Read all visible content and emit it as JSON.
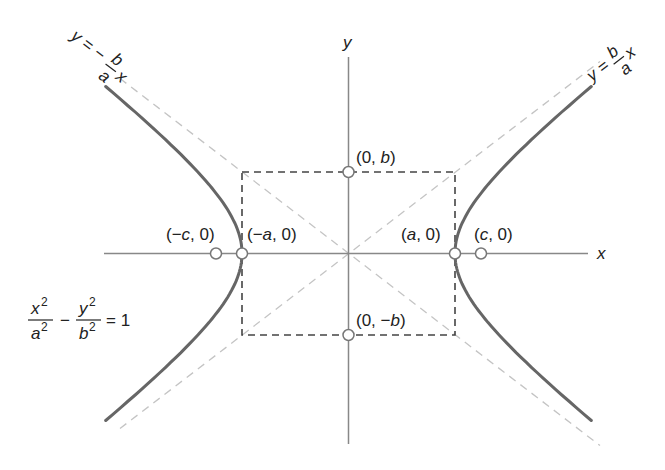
{
  "diagram": {
    "colors": {
      "curve": "#666666",
      "axis": "#888888",
      "asymptote": "#c4c4c4",
      "rectangle": "#444444",
      "text": "#222222",
      "point_fill": "#ffffff"
    },
    "axes": {
      "x_label": "x",
      "y_label": "y"
    },
    "asymptotes": {
      "positive": {
        "lhs": "y =",
        "num": "b",
        "den": "a",
        "var": "x"
      },
      "negative": {
        "lhs": "y = −",
        "num": "b",
        "den": "a",
        "var": "x"
      }
    },
    "points": [
      {
        "id": "vertex-left",
        "label_open": "(−",
        "label_var": "a",
        "label_close": ", 0)"
      },
      {
        "id": "vertex-right",
        "label_open": "(",
        "label_var": "a",
        "label_close": ", 0)"
      },
      {
        "id": "focus-left",
        "label_open": "(−",
        "label_var": "c",
        "label_close": ", 0)"
      },
      {
        "id": "focus-right",
        "label_open": "(",
        "label_var": "c",
        "label_close": ", 0)"
      },
      {
        "id": "covertex-top",
        "label_open": "(0, ",
        "label_var": "b",
        "label_close": ")"
      },
      {
        "id": "covertex-bottom",
        "label_open": "(0, −",
        "label_var": "b",
        "label_close": ")"
      }
    ],
    "equation": {
      "term1_num": "x",
      "term1_num_exp": "2",
      "term1_den": "a",
      "term1_den_exp": "2",
      "minus": "−",
      "term2_num": "y",
      "term2_num_exp": "2",
      "term2_den": "b",
      "term2_den_exp": "2",
      "rhs": "= 1"
    }
  }
}
